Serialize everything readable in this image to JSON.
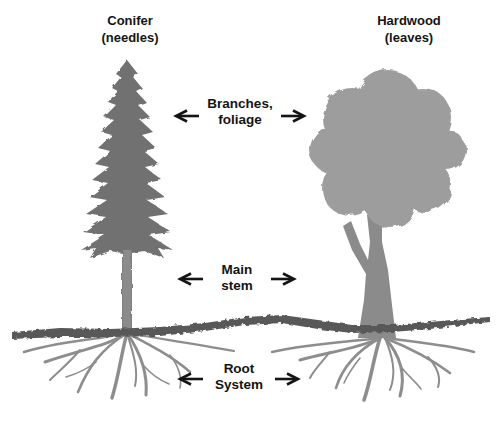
{
  "figure": {
    "type": "tree-comparison-diagram",
    "title_left": {
      "line1": "Conifer",
      "line2": "(needles)"
    },
    "title_right": {
      "line1": "Hardwood",
      "line2": "(leaves)"
    },
    "annotations": {
      "branches": {
        "line1": "Branches,",
        "line2": "foliage"
      },
      "main_stem": {
        "line1": "Main",
        "line2": "stem"
      },
      "root_system": {
        "line1": "Root",
        "line2": "System"
      }
    },
    "icons": {
      "arrow_left": "←",
      "arrow_right": "→"
    },
    "colors": {
      "conifer_crown": "#717171",
      "conifer_trunk": "#8b8b8b",
      "hardwood_crown": "#9d9d9d",
      "hardwood_trunk": "#8b8b8b",
      "ground": "#585858",
      "roots": "#8d8d8d",
      "arrow": "#141414",
      "text": "#141414",
      "background": "#ffffff"
    }
  }
}
